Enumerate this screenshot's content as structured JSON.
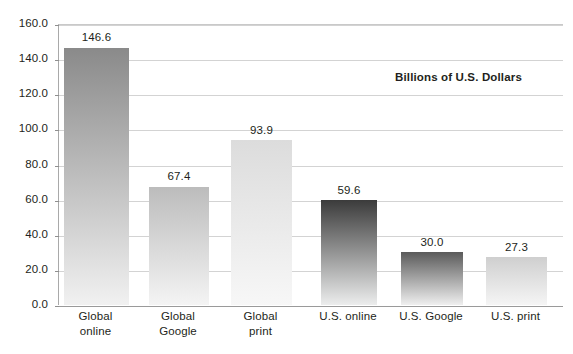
{
  "chart_data": {
    "type": "bar",
    "title": "",
    "subtitle": "",
    "xlabel": "",
    "ylabel": "",
    "annotation": "Billions of U.S. Dollars",
    "ylim": [
      0.0,
      160.0
    ],
    "ytick_step": 20.0,
    "ytick_labels": [
      "160.0",
      "140.0",
      "120.0",
      "100.0",
      "80.0",
      "60.0",
      "40.0",
      "20.0",
      "0.0"
    ],
    "ytick_values": [
      160.0,
      140.0,
      120.0,
      100.0,
      80.0,
      60.0,
      40.0,
      20.0,
      0.0
    ],
    "grid": true,
    "legend": false,
    "categories": [
      "Global\nonline",
      "Global\nGoogle",
      "Global\nprint",
      "U.S. online",
      "U.S. Google",
      "U.S. print"
    ],
    "values": [
      146.6,
      67.4,
      93.9,
      59.6,
      30.0,
      27.3
    ],
    "value_labels": [
      "146.6",
      "67.4",
      "93.9",
      "59.6",
      "30.0",
      "27.3"
    ],
    "bar_colors_top": [
      "#8a8a8a",
      "#bcbcbc",
      "#dcdcdc",
      "#3b3b3b",
      "#5a5a5a",
      "#cfcfcf"
    ],
    "bar_colors_bottom": [
      "#f1f1f1",
      "#f4f4f4",
      "#f7f7f7",
      "#eceded",
      "#efefef",
      "#f5f5f5"
    ]
  },
  "style": {
    "background": "#ffffff",
    "text_color": "#231f20",
    "gridline_color": "#d3d3d3",
    "axis_color": "#a9a9a9",
    "baseline_color": "#9a9a9a"
  },
  "bar_layout": [
    {
      "left": 5,
      "width": 65
    },
    {
      "left": 90,
      "width": 60
    },
    {
      "left": 172,
      "width": 61
    },
    {
      "left": 262,
      "width": 56
    },
    {
      "left": 342,
      "width": 62
    },
    {
      "left": 427,
      "width": 61
    }
  ],
  "label_layout": [
    {
      "left": 0,
      "width": 75
    },
    {
      "left": 85,
      "width": 70
    },
    {
      "left": 167,
      "width": 71
    },
    {
      "left": 250,
      "width": 80
    },
    {
      "left": 330,
      "width": 86
    },
    {
      "left": 420,
      "width": 75
    }
  ],
  "annotation_pos": {
    "left": 395,
    "top": 71
  }
}
